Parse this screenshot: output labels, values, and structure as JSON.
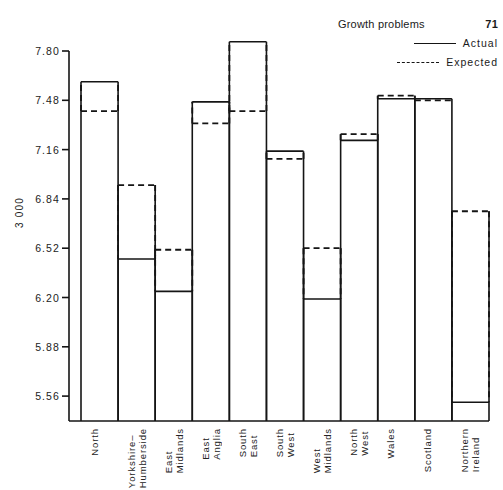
{
  "header": {
    "title": "Growth problems",
    "page_number": "71"
  },
  "legend": {
    "position": "top-right",
    "entries": [
      {
        "label": "Actual",
        "style": "solid",
        "icon": "solid-line-icon"
      },
      {
        "label": "Expected",
        "style": "dashed",
        "icon": "dashed-line-icon"
      }
    ]
  },
  "chart_data": {
    "type": "bar",
    "title": "Growth problems",
    "xlabel": "",
    "ylabel": "3 000",
    "ylim": [
      5.4,
      7.96
    ],
    "grid": false,
    "yticks": [
      "7.80",
      "7.48",
      "7.16",
      "6.84",
      "6.52",
      "6.20",
      "5.88",
      "5.56"
    ],
    "ytick_values": [
      7.8,
      7.48,
      7.16,
      6.84,
      6.52,
      6.2,
      5.88,
      5.56
    ],
    "categories": [
      "North",
      "Yorkshire–Humberside",
      "East Midlands",
      "East Anglia",
      "South East",
      "South West",
      "West Midlands",
      "North West",
      "Wales",
      "Scotland",
      "Northern Ireland"
    ],
    "category_lines": [
      [
        "North"
      ],
      [
        "Yorkshire–",
        "Humberside"
      ],
      [
        "East",
        "Midlands"
      ],
      [
        "East",
        "Anglia"
      ],
      [
        "South",
        "East"
      ],
      [
        "South",
        "West"
      ],
      [
        "West",
        "Midlands"
      ],
      [
        "North",
        "West"
      ],
      [
        "Wales"
      ],
      [
        "Scotland"
      ],
      [
        "Northern",
        "Ireland"
      ]
    ],
    "series": [
      {
        "name": "Actual",
        "style": "solid",
        "values": [
          7.6,
          6.45,
          6.24,
          7.47,
          7.86,
          7.15,
          6.19,
          7.22,
          7.49,
          7.49,
          5.52
        ]
      },
      {
        "name": "Expected",
        "style": "dashed",
        "values": [
          7.41,
          6.93,
          6.51,
          7.33,
          7.41,
          7.1,
          6.52,
          7.26,
          7.51,
          7.48,
          6.76
        ]
      }
    ]
  },
  "colors": {
    "ink": "#151515",
    "background": "#ffffff"
  }
}
